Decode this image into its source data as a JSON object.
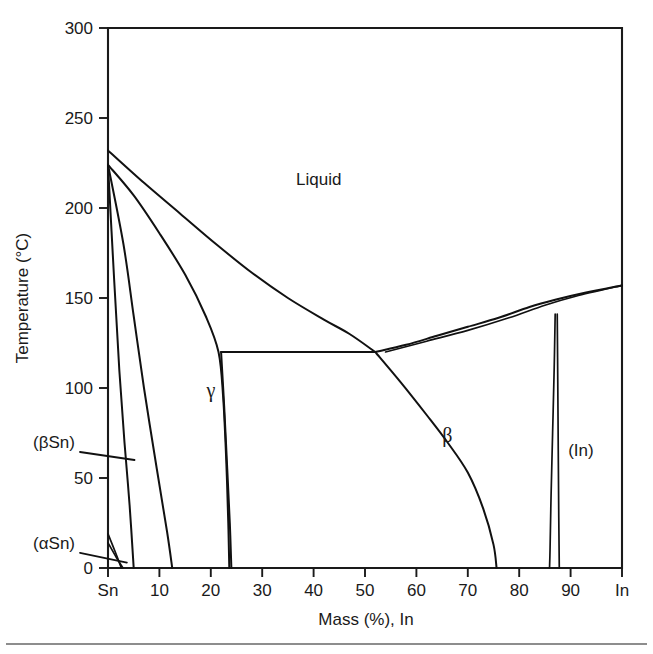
{
  "figure": {
    "kind": "binary-phase-diagram",
    "system": "Sn-In",
    "background_color": "#ffffff",
    "line_color": "#111111"
  },
  "axes": {
    "y_title": "Temperature (°C)",
    "x_title": "Mass (%), In",
    "y_ticks": [
      "0",
      "50",
      "100",
      "150",
      "200",
      "250",
      "300"
    ],
    "y_tick_values": [
      0,
      50,
      100,
      150,
      200,
      250,
      300
    ],
    "y_min": 0,
    "y_max": 300,
    "x_ticks": [
      "Sn",
      "10",
      "20",
      "30",
      "40",
      "50",
      "60",
      "70",
      "80",
      "90",
      "In"
    ],
    "x_tick_values": [
      0,
      10,
      20,
      30,
      40,
      50,
      60,
      70,
      80,
      90,
      100
    ],
    "x_min": 0,
    "x_max": 100,
    "grid": "off"
  },
  "labels": {
    "liquid": "Liquid",
    "gamma": "γ",
    "beta": "β",
    "in_phase": "(In)",
    "beta_sn": "(βSn)",
    "alpha_sn": "(αSn)"
  },
  "chart_data": {
    "type": "line",
    "title": "",
    "subtitle": "",
    "xlabel": "Mass (%), In",
    "ylabel": "Temperature (°C)",
    "xlim": [
      0,
      100
    ],
    "ylim": [
      0,
      300
    ],
    "grid": false,
    "legend_position": "none",
    "annotations": [
      {
        "text": "Liquid",
        "x": 41,
        "y": 213
      },
      {
        "text": "γ",
        "x": 20,
        "y": 95
      },
      {
        "text": "β",
        "x": 66,
        "y": 70
      },
      {
        "text": "(In)",
        "x": 92,
        "y": 62
      },
      {
        "text": "(βSn)",
        "x": -9,
        "y": 70,
        "leader_to": {
          "x": 3.6,
          "y": 60
        }
      },
      {
        "text": "(αSn)",
        "x": -9,
        "y": 14,
        "leader_to": {
          "x": 2.5,
          "y": 3
        }
      }
    ],
    "invariant_points": [
      {
        "name": "Sn melting point",
        "x": 0,
        "y": 232
      },
      {
        "name": "Sn-side peritectic / invariant",
        "x": 0,
        "y": 224
      },
      {
        "name": "eutectic",
        "x": 52,
        "y": 120
      },
      {
        "name": "In-side invariant",
        "x": 87,
        "y": 141
      },
      {
        "name": "In melting point",
        "x": 100,
        "y": 157
      }
    ],
    "series": [
      {
        "name": "liquidus Sn-rich (Sn to eutectic)",
        "points": [
          [
            0,
            232
          ],
          [
            7,
            214
          ],
          [
            14,
            197
          ],
          [
            21,
            180
          ],
          [
            28,
            164
          ],
          [
            35,
            150
          ],
          [
            42,
            138
          ],
          [
            47,
            130
          ],
          [
            52,
            120
          ]
        ]
      },
      {
        "name": "liquidus In-rich (eutectic to In)",
        "points": [
          [
            52,
            120
          ],
          [
            58,
            124
          ],
          [
            64,
            129
          ],
          [
            70,
            134
          ],
          [
            76,
            139
          ],
          [
            82,
            145
          ],
          [
            87,
            149
          ],
          [
            93,
            153
          ],
          [
            100,
            157
          ]
        ]
      },
      {
        "name": "solidus In-rich (beta + In field upper)",
        "points": [
          [
            54,
            120
          ],
          [
            62,
            126
          ],
          [
            70,
            132
          ],
          [
            78,
            139
          ],
          [
            85,
            146
          ],
          [
            91,
            151
          ],
          [
            100,
            157
          ]
        ]
      },
      {
        "name": "(betaSn) solvus",
        "points": [
          [
            0,
            224
          ],
          [
            1.2,
            160
          ],
          [
            2.2,
            110
          ],
          [
            3.2,
            70
          ],
          [
            4.2,
            35
          ],
          [
            5.0,
            0
          ]
        ]
      },
      {
        "name": "(betaSn) solidus",
        "points": [
          [
            0,
            224
          ],
          [
            3.0,
            180
          ],
          [
            5.0,
            140
          ],
          [
            7.0,
            100
          ],
          [
            9.5,
            55
          ],
          [
            11.5,
            20
          ],
          [
            12.5,
            0
          ]
        ]
      },
      {
        "name": "gamma left boundary",
        "points": [
          [
            0,
            224
          ],
          [
            5,
            207
          ],
          [
            10,
            186
          ],
          [
            15,
            163
          ],
          [
            19,
            140
          ],
          [
            21.5,
            120
          ],
          [
            22.4,
            95
          ],
          [
            23.0,
            60
          ],
          [
            23.4,
            25
          ],
          [
            23.6,
            0
          ]
        ]
      },
      {
        "name": "gamma right boundary",
        "points": [
          [
            22.0,
            120
          ],
          [
            22.6,
            90
          ],
          [
            23.2,
            55
          ],
          [
            23.7,
            25
          ],
          [
            24.0,
            0
          ]
        ]
      },
      {
        "name": "eutectic horizontal tie-line",
        "points": [
          [
            22.0,
            120
          ],
          [
            35,
            120
          ],
          [
            52,
            120
          ]
        ]
      },
      {
        "name": "beta left boundary",
        "points": [
          [
            52,
            120
          ],
          [
            57,
            103
          ],
          [
            62,
            85
          ],
          [
            66,
            70
          ],
          [
            70,
            53
          ],
          [
            73,
            33
          ],
          [
            75,
            13
          ],
          [
            75.6,
            0
          ]
        ]
      },
      {
        "name": "(In) left boundary",
        "points": [
          [
            87,
            141
          ],
          [
            86.8,
            110
          ],
          [
            86.5,
            75
          ],
          [
            86.2,
            40
          ],
          [
            86.0,
            10
          ],
          [
            85.9,
            0
          ]
        ]
      },
      {
        "name": "(In) right boundary",
        "points": [
          [
            87.4,
            141
          ],
          [
            87.5,
            105
          ],
          [
            87.6,
            65
          ],
          [
            87.7,
            28
          ],
          [
            87.8,
            0
          ]
        ]
      },
      {
        "name": "(alphaSn) boundary a",
        "points": [
          [
            0,
            19
          ],
          [
            1.4,
            9
          ],
          [
            2.6,
            0
          ]
        ]
      },
      {
        "name": "(alphaSn) boundary b",
        "points": [
          [
            0,
            14
          ],
          [
            1.6,
            6
          ],
          [
            2.9,
            0
          ]
        ]
      }
    ]
  }
}
